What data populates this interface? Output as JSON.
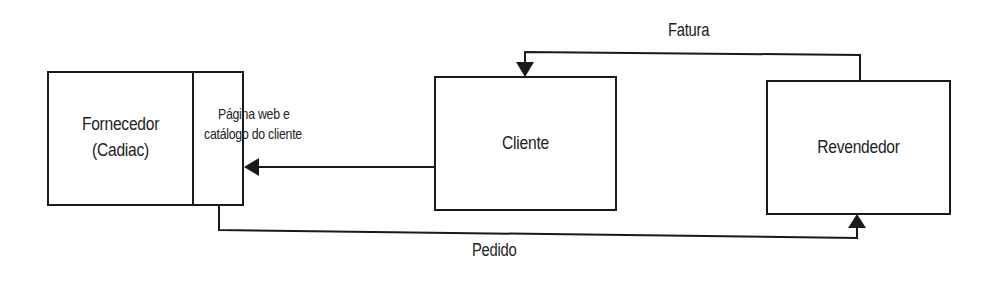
{
  "diagram": {
    "type": "flow",
    "nodes": [
      {
        "id": "fornecedor",
        "label_line1": "Fornecedor",
        "label_line2": "(Cadiac)"
      },
      {
        "id": "pagina",
        "label_line1": "Página web e",
        "label_line2": "catálogo do cliente"
      },
      {
        "id": "cliente",
        "label": "Cliente"
      },
      {
        "id": "revendedor",
        "label": "Revendedor"
      }
    ],
    "edges": [
      {
        "from": "revendedor",
        "to": "cliente",
        "label": "Fatura"
      },
      {
        "from": "cliente",
        "to": "pagina",
        "label": ""
      },
      {
        "from": "pagina",
        "to": "revendedor",
        "label": "Pedido"
      }
    ],
    "colors": {
      "stroke": "#1a1a1a",
      "background": "#ffffff"
    }
  }
}
